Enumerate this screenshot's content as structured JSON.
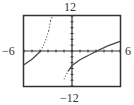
{
  "chart_data": {
    "type": "line",
    "title": "",
    "xlabel": "",
    "ylabel": "",
    "xlim": [
      -6,
      6
    ],
    "ylim": [
      -12,
      12
    ],
    "x_tick_step": 1,
    "y_tick_step": 2,
    "grid": false,
    "legend": null,
    "window_labels": {
      "xmin": "−6",
      "xmax": "6",
      "ymin": "−12",
      "ymax": "12"
    },
    "series": [
      {
        "name": "left-branch",
        "points": [
          [
            -6,
            -4.7
          ],
          [
            -5,
            -2.8
          ],
          [
            -4.3,
            -1
          ],
          [
            -3.9,
            0
          ],
          [
            -3.3,
            3.7
          ],
          [
            -2.9,
            7
          ],
          [
            -2.7,
            10.3
          ],
          [
            -2.4,
            12
          ]
        ],
        "style": "solid-then-dotted"
      },
      {
        "name": "right-branch",
        "points": [
          [
            -1,
            -9.7
          ],
          [
            -0.5,
            -7
          ],
          [
            0,
            -5
          ],
          [
            1,
            -3
          ],
          [
            2.2,
            -1.3
          ],
          [
            3.1,
            0
          ],
          [
            4.4,
            1.7
          ],
          [
            6,
            3.3
          ]
        ],
        "style": "dotted-then-solid"
      }
    ]
  },
  "colors": {
    "frame": "#333333",
    "axis": "#333333",
    "curve": "#444444",
    "background": "#ffffff"
  }
}
